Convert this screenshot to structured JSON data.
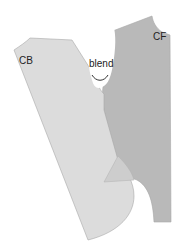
{
  "labels": {
    "back": "CB",
    "front": "CF",
    "note": "blend"
  },
  "colors": {
    "background": "#ffffff",
    "back_piece": "#dcdcdc",
    "front_piece": "#b9b9b9",
    "overlap": "#cdcdcd",
    "outline": "#a8a8a8",
    "arrow": "#333333",
    "text": "#222222"
  }
}
